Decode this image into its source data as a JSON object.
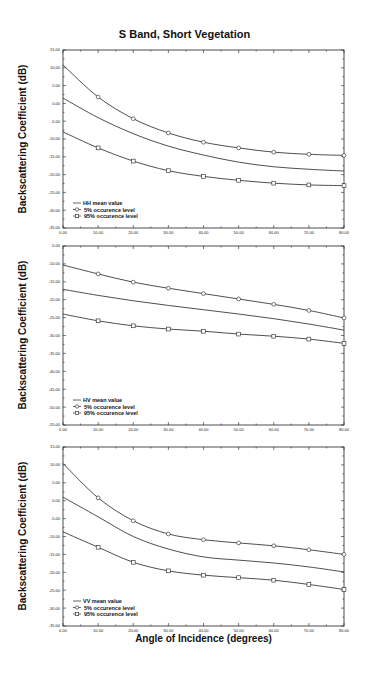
{
  "figure": {
    "title": "S Band, Short Vegetation",
    "xlabel": "Angle of Incidence (degrees)",
    "ylabel": "Backscattering Coefficient (dB)"
  },
  "chart_data": [
    {
      "type": "line",
      "panel": "HH",
      "title": "S Band, Short Vegetation",
      "xlabel": "Angle of Incidence (degrees)",
      "ylabel": "Backscattering Coefficient (dB)",
      "x": [
        0,
        10,
        20,
        30,
        40,
        50,
        60,
        70,
        80
      ],
      "xlim": [
        0,
        80
      ],
      "ylim": [
        -35,
        15
      ],
      "xticks": [
        "0.00",
        "10.00",
        "20.00",
        "30.00",
        "40.00",
        "50.00",
        "60.00",
        "70.00",
        "80.00"
      ],
      "yticks": [
        "15.00",
        "10.00",
        "5.00",
        "0.00",
        "-5.00",
        "-10.00",
        "-15.00",
        "-20.00",
        "-25.00",
        "-30.00",
        "-35.00"
      ],
      "grid": false,
      "legend_position": "lower left",
      "series": [
        {
          "name": "HH mean value",
          "marker": "none",
          "values": [
            1.5,
            -4.0,
            -8.5,
            -12.0,
            -14.5,
            -16.5,
            -17.8,
            -18.5,
            -19.0
          ]
        },
        {
          "name": "5% occurence level",
          "marker": "circle",
          "values": [
            10.8,
            1.8,
            -4.3,
            -8.3,
            -10.9,
            -12.5,
            -13.7,
            -14.3,
            -14.6
          ]
        },
        {
          "name": "95% occurence level",
          "marker": "square",
          "values": [
            -8.0,
            -12.5,
            -16.2,
            -18.9,
            -20.5,
            -21.6,
            -22.4,
            -22.9,
            -23.1
          ]
        }
      ]
    },
    {
      "type": "line",
      "panel": "HV",
      "xlabel": "",
      "ylabel": "Backscattering Coefficient (dB)",
      "x": [
        0,
        10,
        20,
        30,
        40,
        50,
        60,
        70,
        80
      ],
      "xlim": [
        0,
        80
      ],
      "ylim": [
        -55,
        -5
      ],
      "xticks": [
        "0.00",
        "10.00",
        "20.00",
        "30.00",
        "40.00",
        "50.00",
        "60.00",
        "70.00",
        "80.00"
      ],
      "yticks": [
        "-5.00",
        "-10.00",
        "-15.00",
        "-20.00",
        "-25.00",
        "-30.00",
        "-35.00",
        "-40.00",
        "-45.00",
        "-50.00",
        "-55.00"
      ],
      "grid": false,
      "legend_position": "lower left",
      "series": [
        {
          "name": "HV mean value",
          "marker": "none",
          "values": [
            -17.1,
            -18.8,
            -20.3,
            -21.6,
            -22.8,
            -24.0,
            -25.3,
            -26.8,
            -28.5
          ]
        },
        {
          "name": "5% occurence level",
          "marker": "circle",
          "values": [
            -10.3,
            -12.8,
            -15.1,
            -16.8,
            -18.3,
            -19.8,
            -21.3,
            -23.0,
            -25.1
          ]
        },
        {
          "name": "95% occurence level",
          "marker": "square",
          "values": [
            -24.0,
            -25.9,
            -27.3,
            -28.2,
            -28.8,
            -29.6,
            -30.2,
            -31.0,
            -32.2
          ]
        }
      ]
    },
    {
      "type": "line",
      "panel": "VV",
      "xlabel": "Angle of Incidence (degrees)",
      "ylabel": "Backscattering Coefficient (dB)",
      "x": [
        0,
        10,
        20,
        30,
        40,
        50,
        60,
        70,
        80
      ],
      "xlim": [
        0,
        80
      ],
      "ylim": [
        -35,
        15
      ],
      "xticks": [
        "0.00",
        "10.00",
        "20.00",
        "30.00",
        "40.00",
        "50.00",
        "60.00",
        "70.00",
        "80.00"
      ],
      "yticks": [
        "15.00",
        "10.00",
        "5.00",
        "0.00",
        "-5.00",
        "-10.00",
        "-15.00",
        "-20.00",
        "-25.00",
        "-30.00",
        "-35.00"
      ],
      "grid": false,
      "legend_position": "lower left",
      "series": [
        {
          "name": "VV mean value",
          "marker": "none",
          "values": [
            1.0,
            -4.5,
            -10.0,
            -13.5,
            -15.7,
            -16.6,
            -17.4,
            -18.5,
            -19.9
          ]
        },
        {
          "name": "5% occurence level",
          "marker": "circle",
          "values": [
            10.4,
            0.8,
            -5.6,
            -9.3,
            -10.9,
            -11.8,
            -12.6,
            -13.7,
            -15.0
          ]
        },
        {
          "name": "95% occurence level",
          "marker": "square",
          "values": [
            -8.7,
            -13.0,
            -17.2,
            -19.6,
            -20.8,
            -21.5,
            -22.2,
            -23.4,
            -24.8
          ]
        }
      ]
    }
  ]
}
